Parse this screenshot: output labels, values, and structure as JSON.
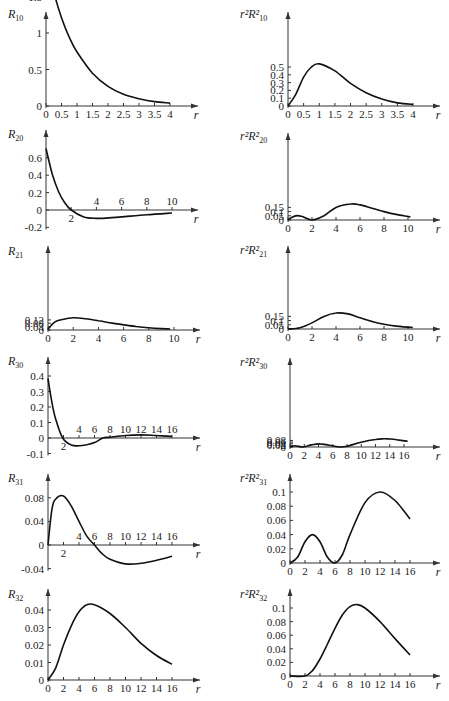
{
  "figure": {
    "colors": {
      "curve": "#111111",
      "axis": "#333333",
      "background": "#ffffff"
    }
  },
  "chart_data": [
    {
      "id": "R10",
      "type": "line",
      "title": "",
      "ylabel": "R",
      "ylabel_sub": "10",
      "xlabel": "r",
      "xlim": [
        0,
        4
      ],
      "ylim": [
        0,
        2
      ],
      "xticks": [
        0,
        0.5,
        1,
        1.5,
        2,
        2.5,
        3,
        3.5,
        4
      ],
      "xtick_labels": [
        "0",
        "0.5",
        "1",
        "1.5",
        "2",
        "2.5",
        "3",
        "3.5",
        "4"
      ],
      "yticks": [
        0,
        0.5,
        1,
        1.5,
        2
      ],
      "ytick_labels": [
        "0",
        "0.5",
        "1",
        "1.5",
        "2"
      ],
      "x": [
        0,
        0.25,
        0.5,
        0.75,
        1,
        1.5,
        2,
        2.5,
        3,
        3.5,
        4
      ],
      "y": [
        2.0,
        1.56,
        1.21,
        0.94,
        0.74,
        0.45,
        0.27,
        0.16,
        0.1,
        0.06,
        0.04
      ],
      "grid": false,
      "legend": null
    },
    {
      "id": "r2R10sq",
      "type": "line",
      "title": "",
      "ylabel": "r²R²",
      "ylabel_sub": "10",
      "xlabel": "r",
      "xlim": [
        0,
        4
      ],
      "ylim": [
        0,
        0.55
      ],
      "xticks": [
        0,
        0.5,
        1,
        1.5,
        2,
        2.5,
        3,
        3.5,
        4
      ],
      "xtick_labels": [
        "0",
        "0.5",
        "1",
        "1.5",
        "2",
        "2.5",
        "3",
        "3.5",
        "4"
      ],
      "yticks": [
        0,
        0.1,
        0.2,
        0.3,
        0.4,
        0.5
      ],
      "ytick_labels": [
        "0",
        "0.1",
        "0.2",
        "0.3",
        "0.4",
        "0.5"
      ],
      "x": [
        0,
        0.25,
        0.5,
        0.75,
        1,
        1.5,
        2,
        2.5,
        3,
        3.5,
        4
      ],
      "y": [
        0,
        0.15,
        0.37,
        0.5,
        0.54,
        0.45,
        0.29,
        0.17,
        0.09,
        0.04,
        0.02
      ],
      "grid": false,
      "legend": null
    },
    {
      "id": "R20",
      "type": "line",
      "title": "",
      "ylabel": "R",
      "ylabel_sub": "20",
      "xlabel": "r",
      "xlim": [
        0,
        10
      ],
      "ylim": [
        -0.2,
        0.7
      ],
      "xticks": [
        2,
        4,
        6,
        8,
        10
      ],
      "xtick_labels": [
        "2",
        "4",
        "6",
        "8",
        "10"
      ],
      "yticks": [
        -0.2,
        0,
        0.2,
        0.4,
        0.6
      ],
      "ytick_labels": [
        "-0.2",
        "0",
        "0.2",
        "0.4",
        "0.6"
      ],
      "x": [
        0,
        0.5,
        1,
        1.5,
        2,
        3,
        4,
        5,
        6,
        8,
        10
      ],
      "y": [
        0.707,
        0.41,
        0.21,
        0.08,
        0,
        -0.08,
        -0.096,
        -0.091,
        -0.079,
        -0.055,
        -0.034
      ],
      "grid": false,
      "legend": null
    },
    {
      "id": "r2R20sq",
      "type": "line",
      "title": "",
      "ylabel": "r²R²",
      "ylabel_sub": "20",
      "xlabel": "r",
      "xlim": [
        0,
        10
      ],
      "ylim": [
        0,
        0.2
      ],
      "xticks": [
        0,
        2,
        4,
        6,
        8,
        10
      ],
      "xtick_labels": [
        "0",
        "2",
        "4",
        "6",
        "8",
        "10"
      ],
      "yticks": [
        0,
        0.05,
        0.1,
        0.15
      ],
      "ytick_labels": [
        "0",
        "0.05",
        "0.1",
        "0.15"
      ],
      "x": [
        0,
        0.3,
        0.76,
        1.2,
        2,
        3,
        4,
        5.24,
        6,
        7,
        8,
        9,
        10.2
      ],
      "y": [
        0,
        0.03,
        0.052,
        0.04,
        0,
        0.05,
        0.15,
        0.191,
        0.18,
        0.14,
        0.1,
        0.067,
        0.036
      ],
      "grid": false,
      "legend": null
    },
    {
      "id": "R21",
      "type": "line",
      "title": "",
      "ylabel": "R",
      "ylabel_sub": "21",
      "xlabel": "r",
      "xlim": [
        0,
        10
      ],
      "ylim": [
        0,
        0.15
      ],
      "xticks": [
        0,
        2,
        4,
        6,
        8,
        10
      ],
      "xtick_labels": [
        "0",
        "2",
        "4",
        "6",
        "8",
        "10"
      ],
      "yticks": [
        0,
        0.04,
        0.08,
        0.12
      ],
      "ytick_labels": [
        "0",
        "0.04",
        "0.08",
        "0.12"
      ],
      "x": [
        0,
        0.5,
        1,
        2,
        3,
        4,
        5,
        6,
        7,
        8,
        9,
        9.7
      ],
      "y": [
        0.01,
        0.09,
        0.12,
        0.145,
        0.133,
        0.11,
        0.085,
        0.061,
        0.042,
        0.027,
        0.017,
        0.012
      ],
      "grid": false,
      "legend": null
    },
    {
      "id": "r2R21sq",
      "type": "line",
      "title": "",
      "ylabel": "r²R²",
      "ylabel_sub": "21",
      "xlabel": "r",
      "xlim": [
        0,
        10
      ],
      "ylim": [
        0,
        0.2
      ],
      "xticks": [
        0,
        2,
        4,
        6,
        8,
        10
      ],
      "xtick_labels": [
        "0",
        "2",
        "4",
        "6",
        "8",
        "10"
      ],
      "yticks": [
        0,
        0.05,
        0.1,
        0.15
      ],
      "ytick_labels": [
        "0",
        "0.05",
        "0.1",
        "0.15"
      ],
      "x": [
        0,
        1,
        2,
        3,
        4,
        5,
        6,
        7,
        8,
        9,
        10.4
      ],
      "y": [
        0,
        0.015,
        0.073,
        0.15,
        0.191,
        0.18,
        0.134,
        0.09,
        0.057,
        0.035,
        0.018
      ],
      "grid": false,
      "legend": null
    },
    {
      "id": "R30",
      "type": "line",
      "title": "",
      "ylabel": "R",
      "ylabel_sub": "30",
      "xlabel": "r",
      "xlim": [
        0,
        16
      ],
      "ylim": [
        -0.1,
        0.4
      ],
      "xticks": [
        2,
        4,
        6,
        8,
        10,
        12,
        14,
        16
      ],
      "xtick_labels": [
        "2",
        "4",
        "6",
        "8",
        "10",
        "12",
        "14",
        "16"
      ],
      "yticks": [
        -0.1,
        0,
        0.1,
        0.2,
        0.3,
        0.4
      ],
      "ytick_labels": [
        "-0.1",
        "0",
        "0.1",
        "0.2",
        "0.3",
        "0.4"
      ],
      "x": [
        0,
        0.5,
        1,
        1.9,
        3,
        4,
        5,
        6,
        7.1,
        8,
        10,
        12,
        14,
        16
      ],
      "y": [
        0.385,
        0.23,
        0.12,
        0,
        -0.045,
        -0.05,
        -0.043,
        -0.03,
        0,
        0.005,
        0.016,
        0.02,
        0.016,
        0.01
      ],
      "grid": false,
      "legend": null
    },
    {
      "id": "r2R30sq",
      "type": "line",
      "title": "",
      "ylabel": "r²R²",
      "ylabel_sub": "30",
      "xlabel": "r",
      "xlim": [
        0,
        16
      ],
      "ylim": [
        0,
        0.1
      ],
      "xticks": [
        0,
        2,
        4,
        6,
        8,
        10,
        12,
        14,
        16
      ],
      "xtick_labels": [
        "0",
        "2",
        "4",
        "6",
        "8",
        "10",
        "12",
        "14",
        "16"
      ],
      "yticks": [
        0,
        0.02,
        0.04,
        0.06,
        0.08
      ],
      "ytick_labels": [
        "0",
        "0.02",
        "0.04",
        "0.06",
        "0.08"
      ],
      "x": [
        0,
        0.7,
        1.9,
        3,
        4.2,
        5.5,
        7.1,
        8,
        10,
        12,
        13.1,
        14,
        15,
        16.5
      ],
      "y": [
        0,
        0.015,
        0,
        0.025,
        0.038,
        0.022,
        0,
        0.01,
        0.058,
        0.092,
        0.1,
        0.097,
        0.088,
        0.07
      ],
      "grid": false,
      "legend": null
    },
    {
      "id": "R31",
      "type": "line",
      "title": "",
      "ylabel": "R",
      "ylabel_sub": "31",
      "xlabel": "r",
      "xlim": [
        0,
        16
      ],
      "ylim": [
        -0.04,
        0.09
      ],
      "xticks": [
        2,
        4,
        6,
        8,
        10,
        12,
        14,
        16
      ],
      "xtick_labels": [
        "2",
        "4",
        "6",
        "8",
        "10",
        "12",
        "14",
        "16"
      ],
      "yticks": [
        -0.04,
        0,
        0.04,
        0.08
      ],
      "ytick_labels": [
        "-0.04",
        "0",
        "0.04",
        "0.08"
      ],
      "x": [
        0,
        0.5,
        1,
        2,
        3,
        4,
        5,
        6,
        7,
        8,
        10,
        12,
        14,
        16
      ],
      "y": [
        0,
        0.06,
        0.078,
        0.083,
        0.066,
        0.04,
        0.015,
        0,
        -0.015,
        -0.024,
        -0.032,
        -0.031,
        -0.026,
        -0.019
      ],
      "grid": false,
      "legend": null
    },
    {
      "id": "r2R31sq",
      "type": "line",
      "title": "",
      "ylabel": "r²R²",
      "ylabel_sub": "31",
      "xlabel": "r",
      "xlim": [
        0,
        16
      ],
      "ylim": [
        0,
        0.11
      ],
      "xticks": [
        0,
        2,
        4,
        6,
        8,
        10,
        12,
        14,
        16
      ],
      "xtick_labels": [
        "0",
        "2",
        "4",
        "6",
        "8",
        "10",
        "12",
        "14",
        "16"
      ],
      "yticks": [
        0,
        0.02,
        0.04,
        0.06,
        0.08,
        0.1
      ],
      "ytick_labels": [
        "0",
        "0.02",
        "0.04",
        "0.06",
        "0.08",
        "0.1"
      ],
      "x": [
        0,
        1,
        2,
        3,
        4,
        5,
        6,
        7,
        8,
        10,
        12,
        14,
        16
      ],
      "y": [
        0,
        0.008,
        0.03,
        0.04,
        0.03,
        0.008,
        0,
        0.012,
        0.04,
        0.085,
        0.1,
        0.088,
        0.062
      ],
      "grid": false,
      "legend": null
    },
    {
      "id": "R32",
      "type": "line",
      "title": "",
      "ylabel": "R",
      "ylabel_sub": "32",
      "xlabel": "r",
      "xlim": [
        0,
        16
      ],
      "ylim": [
        0,
        0.045
      ],
      "xticks": [
        0,
        2,
        4,
        6,
        8,
        10,
        12,
        14,
        16
      ],
      "xtick_labels": [
        "0",
        "2",
        "4",
        "6",
        "8",
        "10",
        "12",
        "14",
        "16"
      ],
      "yticks": [
        0,
        0.01,
        0.02,
        0.03,
        0.04
      ],
      "ytick_labels": [
        "0",
        "0.01",
        "0.02",
        "0.03",
        "0.04"
      ],
      "x": [
        0,
        1,
        2,
        3,
        4,
        5,
        6,
        8,
        10,
        12,
        14,
        16
      ],
      "y": [
        0,
        0.007,
        0.02,
        0.031,
        0.039,
        0.043,
        0.043,
        0.038,
        0.03,
        0.021,
        0.014,
        0.009
      ],
      "grid": false,
      "legend": null
    },
    {
      "id": "r2R32sq",
      "type": "line",
      "title": "",
      "ylabel": "r²R²",
      "ylabel_sub": "32",
      "xlabel": "r",
      "xlim": [
        0,
        16
      ],
      "ylim": [
        0,
        0.11
      ],
      "xticks": [
        0,
        2,
        4,
        6,
        8,
        10,
        12,
        14,
        16
      ],
      "xtick_labels": [
        "0",
        "2",
        "4",
        "6",
        "8",
        "10",
        "12",
        "14",
        "16"
      ],
      "yticks": [
        0,
        0.02,
        0.04,
        0.06,
        0.08,
        0.1
      ],
      "ytick_labels": [
        "0",
        "0.02",
        "0.04",
        "0.06",
        "0.08",
        "0.1"
      ],
      "x": [
        0,
        2,
        3,
        4,
        5,
        6,
        7,
        8,
        9,
        10,
        12,
        14,
        16
      ],
      "y": [
        0,
        0,
        0.008,
        0.025,
        0.047,
        0.07,
        0.09,
        0.102,
        0.105,
        0.1,
        0.08,
        0.055,
        0.031
      ],
      "grid": false,
      "legend": null
    }
  ],
  "layout": [
    {
      "ox": 46,
      "oy": 106,
      "xpx": 124,
      "ypx": 73,
      "top": 12,
      "right": 198,
      "yl": [
        8,
        18
      ]
    },
    {
      "ox": 288,
      "oy": 106,
      "xpx": 125,
      "ypx": 78,
      "top": 12,
      "right": 440,
      "yl": [
        240,
        18
      ]
    },
    {
      "ox": 46,
      "oy": 210,
      "xpx": 126,
      "ypx": 87,
      "top": 130,
      "right": 198,
      "yl": [
        8,
        138
      ]
    },
    {
      "ox": 288,
      "oy": 220,
      "xpx": 120,
      "ypx": 84,
      "top": 133,
      "right": 440,
      "yl": [
        240,
        140
      ]
    },
    {
      "ox": 48,
      "oy": 330,
      "xpx": 126,
      "ypx": 84,
      "top": 246,
      "right": 200,
      "yl": [
        8,
        255
      ]
    },
    {
      "ox": 288,
      "oy": 329,
      "xpx": 120,
      "ypx": 84,
      "top": 246,
      "right": 440,
      "yl": [
        240,
        254
      ]
    },
    {
      "ox": 48,
      "oy": 438,
      "xpx": 124,
      "ypx": 155,
      "top": 357,
      "right": 200,
      "yl": [
        8,
        365
      ]
    },
    {
      "ox": 290,
      "oy": 447,
      "xpx": 114,
      "ypx": 82,
      "top": 358,
      "right": 440,
      "yl": [
        240,
        366
      ]
    },
    {
      "ox": 48,
      "oy": 545,
      "xpx": 124,
      "ypx": 590,
      "top": 474,
      "right": 200,
      "yl": [
        8,
        482
      ]
    },
    {
      "ox": 290,
      "oy": 563,
      "xpx": 120,
      "ypx": 710,
      "top": 474,
      "right": 440,
      "yl": [
        240,
        482
      ]
    },
    {
      "ox": 48,
      "oy": 680,
      "xpx": 124,
      "ypx": 1750,
      "top": 589,
      "right": 200,
      "yl": [
        8,
        598
      ]
    },
    {
      "ox": 290,
      "oy": 676,
      "xpx": 120,
      "ypx": 680,
      "top": 589,
      "right": 440,
      "yl": [
        240,
        598
      ]
    }
  ]
}
